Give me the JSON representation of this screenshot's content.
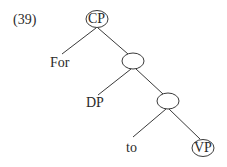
{
  "example_number": "(39)",
  "tree": {
    "root": {
      "label": "CP",
      "circled": true
    },
    "nodes": [
      {
        "id": "n1",
        "label": "",
        "circled": true
      },
      {
        "id": "n2",
        "label": "",
        "circled": true
      }
    ],
    "leaves": [
      {
        "id": "for",
        "label": "For"
      },
      {
        "id": "dp",
        "label": "DP"
      },
      {
        "id": "to",
        "label": "to"
      },
      {
        "id": "vp",
        "label": "VP",
        "circled": true
      }
    ]
  }
}
